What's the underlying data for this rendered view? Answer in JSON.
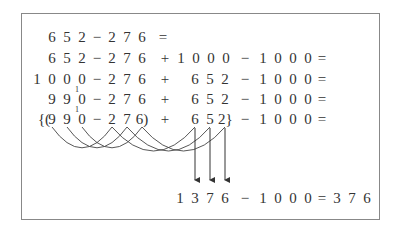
{
  "rows": [
    {
      "y": 37,
      "cells": [
        [
          52,
          "6"
        ],
        [
          67,
          "5"
        ],
        [
          82,
          "2"
        ],
        [
          97,
          "−"
        ],
        [
          112,
          "2"
        ],
        [
          127,
          "7"
        ],
        [
          142,
          "6"
        ],
        [
          163,
          "="
        ]
      ]
    },
    {
      "y": 58,
      "cells": [
        [
          52,
          "6"
        ],
        [
          67,
          "5"
        ],
        [
          82,
          "2"
        ],
        [
          97,
          "−"
        ],
        [
          112,
          "2"
        ],
        [
          127,
          "7"
        ],
        [
          142,
          "6"
        ],
        [
          165,
          "+"
        ],
        [
          181,
          "1"
        ],
        [
          196,
          "0"
        ],
        [
          211,
          "0"
        ],
        [
          226,
          "0"
        ],
        [
          245,
          "−"
        ],
        [
          263,
          "1"
        ],
        [
          278,
          "0"
        ],
        [
          293,
          "0"
        ],
        [
          308,
          "0"
        ],
        [
          322,
          "="
        ]
      ]
    },
    {
      "y": 79,
      "cells": [
        [
          37,
          "1"
        ],
        [
          52,
          "0"
        ],
        [
          67,
          "0"
        ],
        [
          82,
          "0"
        ],
        [
          97,
          "−"
        ],
        [
          112,
          "2"
        ],
        [
          127,
          "7"
        ],
        [
          142,
          "6"
        ],
        [
          165,
          "+"
        ],
        [
          195,
          "6"
        ],
        [
          210,
          "5"
        ],
        [
          225,
          "2"
        ],
        [
          245,
          "−"
        ],
        [
          263,
          "1"
        ],
        [
          278,
          "0"
        ],
        [
          293,
          "0"
        ],
        [
          308,
          "0"
        ],
        [
          322,
          "="
        ]
      ]
    },
    {
      "y": 99,
      "cells": [
        [
          52,
          "9"
        ],
        [
          67,
          "9"
        ],
        [
          82,
          "0"
        ],
        [
          97,
          "−"
        ],
        [
          112,
          "2"
        ],
        [
          127,
          "7"
        ],
        [
          142,
          "6"
        ],
        [
          165,
          "+"
        ],
        [
          195,
          "6"
        ],
        [
          210,
          "5"
        ],
        [
          225,
          "2"
        ],
        [
          245,
          "−"
        ],
        [
          263,
          "1"
        ],
        [
          278,
          "0"
        ],
        [
          293,
          "0"
        ],
        [
          308,
          "0"
        ],
        [
          322,
          "="
        ]
      ]
    },
    {
      "y": 119,
      "cells": [
        [
          44,
          "{("
        ],
        [
          52,
          "9"
        ],
        [
          67,
          "9"
        ],
        [
          82,
          "0"
        ],
        [
          97,
          "−"
        ],
        [
          112,
          "2"
        ],
        [
          127,
          "7"
        ],
        [
          142,
          "6)"
        ],
        [
          165,
          "+"
        ],
        [
          195,
          "6"
        ],
        [
          210,
          "5"
        ],
        [
          225,
          "2}"
        ],
        [
          245,
          "−"
        ],
        [
          263,
          "1"
        ],
        [
          278,
          "0"
        ],
        [
          293,
          "0"
        ],
        [
          308,
          "0"
        ],
        [
          322,
          "="
        ]
      ]
    }
  ],
  "carry_marks": [
    {
      "x": 77,
      "y": 90,
      "text": "1"
    },
    {
      "x": 77,
      "y": 110,
      "text": "1"
    }
  ],
  "result_row": {
    "y": 198,
    "cells": [
      [
        180,
        "1"
      ],
      [
        195,
        "3"
      ],
      [
        210,
        "7"
      ],
      [
        225,
        "6"
      ],
      [
        245,
        "−"
      ],
      [
        263,
        "1"
      ],
      [
        278,
        "0"
      ],
      [
        293,
        "0"
      ],
      [
        308,
        "0"
      ],
      [
        322,
        "="
      ],
      [
        337,
        "3"
      ],
      [
        352,
        "7"
      ],
      [
        367,
        "6"
      ]
    ]
  },
  "arrows": [
    {
      "x": 195,
      "from_y": 128,
      "to_y": 180
    },
    {
      "x": 210,
      "from_y": 128,
      "to_y": 180
    },
    {
      "x": 225,
      "from_y": 128,
      "to_y": 180
    }
  ],
  "arcs": [
    {
      "from": 52,
      "to": 112,
      "depth": 26
    },
    {
      "from": 67,
      "to": 127,
      "depth": 26
    },
    {
      "from": 82,
      "to": 142,
      "depth": 26
    },
    {
      "from": 112,
      "to": 195,
      "depth": 30
    },
    {
      "from": 127,
      "to": 210,
      "depth": 30
    },
    {
      "from": 142,
      "to": 225,
      "depth": 30
    }
  ]
}
